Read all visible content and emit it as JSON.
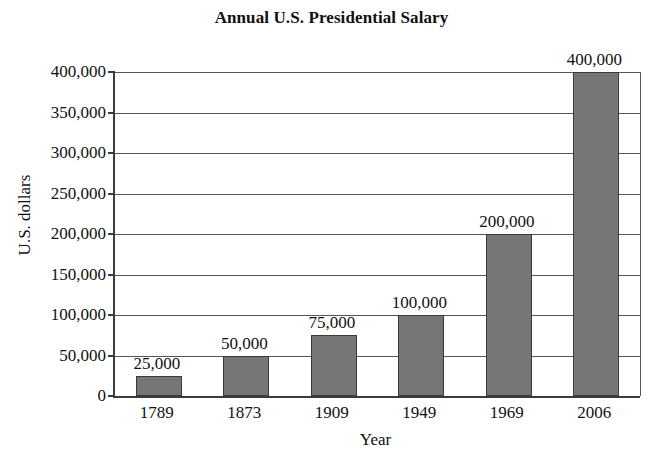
{
  "chart_data": {
    "type": "bar",
    "title": "Annual U.S. Presidential Salary",
    "xlabel": "Year",
    "ylabel": "U.S. dollars",
    "categories": [
      "1789",
      "1873",
      "1909",
      "1949",
      "1969",
      "2006"
    ],
    "values": [
      25000,
      50000,
      75000,
      100000,
      200000,
      400000
    ],
    "value_labels": [
      "25,000",
      "50,000",
      "75,000",
      "100,000",
      "200,000",
      "400,000"
    ],
    "ylim": [
      0,
      400000
    ],
    "yticks": [
      0,
      50000,
      100000,
      150000,
      200000,
      250000,
      300000,
      350000,
      400000
    ],
    "ytick_labels": [
      "0",
      "50,000",
      "100,000",
      "150,000",
      "200,000",
      "250,000",
      "300,000",
      "350,000",
      "400,000"
    ],
    "grid": "horizontal",
    "legend": "none",
    "bar_color": "#767676",
    "bar_edge_color": "#3a3a3a",
    "axis_color": "#3b3b3b",
    "grid_color": "#56565a",
    "background_color": "#ffffff"
  }
}
